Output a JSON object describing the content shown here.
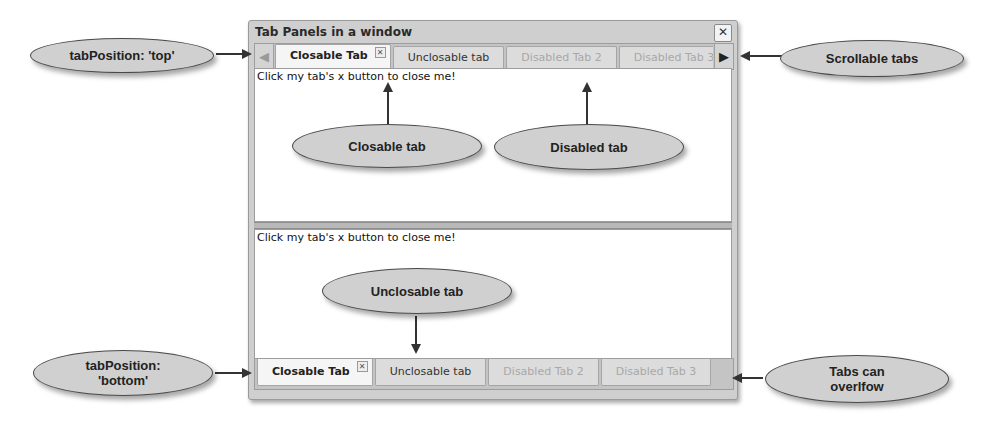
{
  "window": {
    "title": "Tab Panels in a window",
    "close_icon": "close-icon"
  },
  "top_tabpanel": {
    "scroll_left_icon": "arrow-left-icon",
    "scroll_right_icon": "arrow-right-icon",
    "tabs": [
      {
        "label": "Closable Tab",
        "state": "active",
        "closable": true
      },
      {
        "label": "Unclosable tab",
        "state": "normal",
        "closable": false
      },
      {
        "label": "Disabled Tab 2",
        "state": "disabled",
        "closable": false
      },
      {
        "label": "Disabled Tab 3",
        "state": "disabled",
        "closable": false
      }
    ],
    "tab_close_glyph": "✕",
    "body_text": "Click my tab's x button to close me!"
  },
  "bottom_tabpanel": {
    "tabs": [
      {
        "label": "Closable Tab",
        "state": "active",
        "closable": true
      },
      {
        "label": "Unclosable tab",
        "state": "normal",
        "closable": false
      },
      {
        "label": "Disabled Tab 2",
        "state": "disabled",
        "closable": false
      },
      {
        "label": "Disabled Tab 3",
        "state": "disabled",
        "closable": false
      }
    ],
    "tab_close_glyph": "✕",
    "body_text": "Click my tab's x button to close me!"
  },
  "callouts": {
    "tab_position_top": "tabPosition: 'top'",
    "scrollable_tabs": "Scrollable tabs",
    "closable_tab": "Closable tab",
    "disabled_tab": "Disabled tab",
    "unclosable_tab": "Unclosable tab",
    "tab_position_bottom": "tabPosition: 'bottom'",
    "tabs_overflow": "Tabs can overlfow"
  },
  "glyphs": {
    "close": "✕",
    "left": "🡐",
    "right": "➜"
  }
}
